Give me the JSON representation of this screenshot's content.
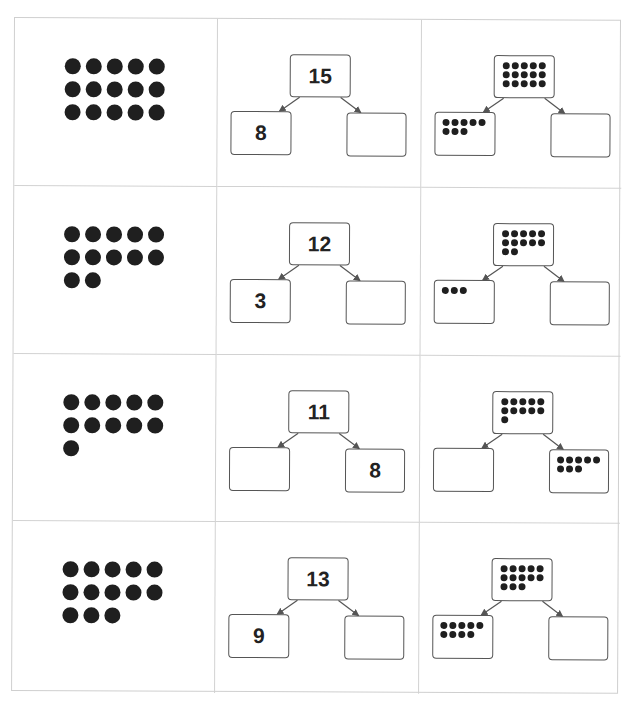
{
  "worksheet": {
    "title": "Number bonds (part-part-whole)",
    "rows": [
      {
        "dot_array": {
          "count": 15,
          "per_row": 5
        },
        "numeric_bond": {
          "whole": "15",
          "left": "8",
          "right": ""
        },
        "dot_bond": {
          "whole_dots": 15,
          "left_dots": 8,
          "right_dots": 0
        }
      },
      {
        "dot_array": {
          "count": 12,
          "per_row": 5
        },
        "numeric_bond": {
          "whole": "12",
          "left": "3",
          "right": ""
        },
        "dot_bond": {
          "whole_dots": 12,
          "left_dots": 3,
          "right_dots": 0
        }
      },
      {
        "dot_array": {
          "count": 11,
          "per_row": 5
        },
        "numeric_bond": {
          "whole": "11",
          "left": "",
          "right": "8"
        },
        "dot_bond": {
          "whole_dots": 11,
          "left_dots": 0,
          "right_dots": 8
        }
      },
      {
        "dot_array": {
          "count": 13,
          "per_row": 5
        },
        "numeric_bond": {
          "whole": "13",
          "left": "9",
          "right": ""
        },
        "dot_bond": {
          "whole_dots": 13,
          "left_dots": 9,
          "right_dots": 0
        }
      }
    ]
  },
  "colors": {
    "dot": "#1f1f1f",
    "grid_line": "#d2d2d2",
    "box_border": "#555555",
    "text": "#222222"
  }
}
